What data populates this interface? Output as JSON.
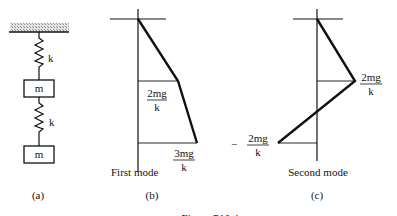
{
  "figure": {
    "caption": "Figure P10.4",
    "panel_a": {
      "label": "(a)",
      "spring_top_label": "k",
      "mass_top_label": "m",
      "spring_bottom_label": "k",
      "mass_bottom_label": "m"
    },
    "panel_b": {
      "label": "(b)",
      "mode_title": "First mode",
      "value1_num": "2mg",
      "value1_den": "k",
      "value2_num": "3mg",
      "value2_den": "k"
    },
    "panel_c": {
      "label": "(c)",
      "mode_title": "Second mode",
      "value1_num": "2mg",
      "value1_den": "k",
      "value2_sign": "−",
      "value2_num": "2mg",
      "value2_den": "k"
    }
  }
}
